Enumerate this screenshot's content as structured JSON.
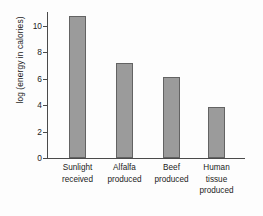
{
  "chart_data": {
    "type": "bar",
    "title": "",
    "xlabel": "",
    "ylabel": "log (energy in calories)",
    "categories": [
      "Sunlight received",
      "Alfalfa produced",
      "Beef produced",
      "Human tissue produced"
    ],
    "category_lines": [
      [
        "Sunlight",
        "received"
      ],
      [
        "Alfalfa",
        "produced"
      ],
      [
        "Beef",
        "produced"
      ],
      [
        "Human",
        "tissue",
        "produced"
      ]
    ],
    "values": [
      10.75,
      7.15,
      6.1,
      3.85
    ],
    "ylim": [
      0,
      11.6
    ],
    "yticks": [
      0,
      2,
      4,
      6,
      8,
      10
    ],
    "ytick_labels": [
      "0",
      "2",
      "4",
      "6",
      "8",
      "10"
    ],
    "grid": false,
    "legend": "none",
    "bar_color": "#9b9b9b",
    "bar_border_color": "#636363",
    "axis_color": "#4a4a4a",
    "background_color": "#fdfdfd"
  }
}
